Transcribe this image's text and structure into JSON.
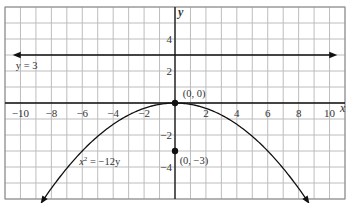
{
  "chart_data": {
    "type": "line",
    "title": "",
    "xlabel": "x",
    "ylabel": "y",
    "xlim": [
      -11,
      11
    ],
    "ylim": [
      -6,
      6
    ],
    "grid": true,
    "x_ticks": [
      -10,
      -8,
      -6,
      -4,
      -2,
      2,
      4,
      6,
      8,
      10
    ],
    "x_tick_labels": [
      "−10",
      "−8",
      "−6",
      "−4",
      "−2",
      "2",
      "4",
      "6",
      "8",
      "10"
    ],
    "y_ticks": [
      4,
      2,
      -2,
      -4
    ],
    "y_tick_labels": [
      "4",
      "2",
      "−2",
      "−4"
    ],
    "series": [
      {
        "name": "x² = −12y",
        "kind": "parabola",
        "equation": "y = -x^2/12",
        "x": [
          -8.6,
          -8,
          -6,
          -4,
          -2,
          0,
          2,
          4,
          6,
          8,
          8.6
        ],
        "y": [
          -6.16,
          -5.33,
          -3,
          -1.33,
          -0.33,
          0,
          -0.33,
          -1.33,
          -3,
          -5.33,
          -6.16
        ],
        "arrows": "both"
      },
      {
        "name": "y = 3",
        "kind": "horizontal_line",
        "y_value": 3,
        "x_range": [
          -10.5,
          10.5
        ],
        "arrows": "both"
      }
    ],
    "points": [
      {
        "label": "(0, 0)",
        "x": 0,
        "y": 0
      },
      {
        "label": "(0, −3)",
        "x": 0,
        "y": -3
      }
    ],
    "annotations": [
      {
        "text": "y = 3",
        "x": -10.3,
        "y": 2.4
      },
      {
        "text": "x² = −12y",
        "x": -6,
        "y": -4.2
      },
      {
        "text": "(0, 0)",
        "x": 0.6,
        "y": 0.5
      },
      {
        "text": "(0, −3)",
        "x": 0.4,
        "y": -3.6
      }
    ]
  },
  "labels": {
    "x_axis": "x",
    "y_axis": "y",
    "directrix": "y = 3",
    "parabola_eq_lhs": "x",
    "parabola_eq_sup": "2",
    "parabola_eq_rhs": " = −12y",
    "vertex": "(0, 0)",
    "focus": "(0, −3)"
  }
}
